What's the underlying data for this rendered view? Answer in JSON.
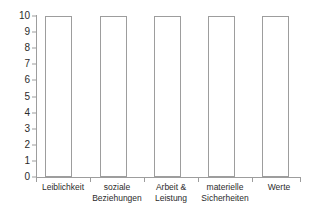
{
  "chart_data": {
    "type": "bar",
    "title": "",
    "subtitle": "",
    "xlabel": "",
    "ylabel": "",
    "categories": [
      "Leiblichkeit",
      "soziale Beziehungen",
      "Arbeit & Leistung",
      "materielle Sicherheiten",
      "Werte"
    ],
    "category_lines": [
      [
        "Leiblichkeit"
      ],
      [
        "soziale",
        "Beziehungen"
      ],
      [
        "Arbeit &",
        "Leistung"
      ],
      [
        "materielle",
        "Sicherheiten"
      ],
      [
        "Werte"
      ]
    ],
    "values": [
      10,
      10,
      10,
      10,
      10
    ],
    "ylim": [
      0,
      10
    ],
    "ytick_labels": [
      "0",
      "1",
      "2",
      "3",
      "4",
      "5",
      "6",
      "7",
      "8",
      "9",
      "10"
    ],
    "ytick_values": [
      0,
      1,
      2,
      3,
      4,
      5,
      6,
      7,
      8,
      9,
      10
    ],
    "grid": false,
    "legend": null,
    "annotations": [],
    "colors": {
      "background": "#ffffff",
      "bar_fill": "#ffffff",
      "bar_outline": "#9d9d9d",
      "axis": "#9d9d9d",
      "text": "#2b2b2b"
    }
  }
}
